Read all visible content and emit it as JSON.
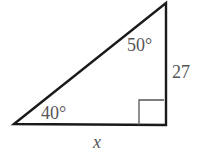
{
  "diagram": {
    "type": "right-triangle",
    "stroke_color": "#1a1a1a",
    "label_color": "#555555",
    "angles": {
      "bottom_left": "40°",
      "top": "50°",
      "bottom_right": "right-angle"
    },
    "sides": {
      "vertical_leg": "27",
      "horizontal_leg": "x"
    }
  }
}
